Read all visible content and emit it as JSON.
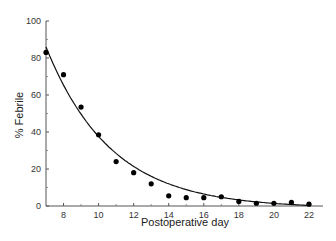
{
  "chart_data": {
    "type": "scatter",
    "title": "",
    "xlabel": "Postoperative day",
    "ylabel": "% Febrile",
    "xlim": [
      7,
      22.8
    ],
    "ylim": [
      0,
      100
    ],
    "x_ticks": [
      8,
      10,
      12,
      14,
      16,
      18,
      20,
      22
    ],
    "x_minor_ticks": [
      9,
      11,
      13,
      15,
      17,
      19,
      21
    ],
    "y_ticks": [
      0,
      20,
      40,
      60,
      80,
      100
    ],
    "y_minor_ticks": [
      10,
      30,
      50,
      70,
      90
    ],
    "grid": false,
    "legend": null,
    "series": [
      {
        "name": "Observed",
        "style": "points",
        "x": [
          7,
          8,
          9,
          10,
          11,
          12,
          13,
          14,
          15,
          16,
          17,
          18,
          19,
          20,
          21,
          22
        ],
        "y": [
          83,
          71,
          53.5,
          38.5,
          24,
          18,
          12,
          5.5,
          4.5,
          4.5,
          5,
          2.5,
          1.5,
          1.5,
          2,
          1
        ]
      },
      {
        "name": "Fitted exponential curve",
        "style": "line",
        "model": "y = 86 * exp(-0.27 * (x - 7))",
        "x": [
          7,
          8,
          9,
          10,
          11,
          12,
          13,
          14,
          15,
          16,
          17,
          18,
          19,
          20,
          21,
          22
        ],
        "y": [
          86,
          65.6,
          50.1,
          38.2,
          29.2,
          22.3,
          17,
          13,
          9.9,
          7.6,
          5.8,
          4.4,
          3.4,
          2.6,
          2,
          1.5
        ]
      }
    ]
  }
}
